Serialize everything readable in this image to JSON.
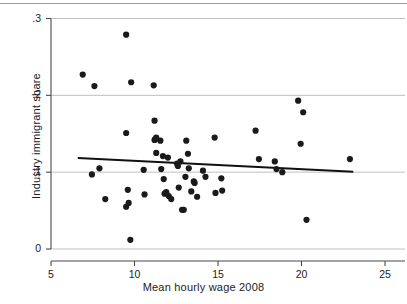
{
  "figure": {
    "background_color": "#ffffff",
    "ink_color": "#1c1c1c",
    "grid_color": "#bfbfbf",
    "axis_color": "#4a4a4a",
    "marker_color": "#1a1a1a",
    "fit_line_color": "#111111"
  },
  "chart_data": {
    "type": "scatter",
    "title": "",
    "subtitle": "",
    "xlabel": "Mean hourly wage 2008",
    "ylabel": "Industry immigrant share",
    "xlim": [
      5,
      25
    ],
    "ylim": [
      0,
      0.3
    ],
    "xticks": [
      5,
      10,
      15,
      20,
      25
    ],
    "xtick_labels": [
      "5",
      "10",
      "15",
      "20",
      "25"
    ],
    "yticks": [
      0,
      0.1,
      0.2,
      0.3
    ],
    "ytick_labels": [
      "0",
      ".1",
      ".2",
      ".3"
    ],
    "grid": "horizontal",
    "grid_values": [
      0,
      0.1,
      0.2,
      0.3
    ],
    "legend": "none",
    "legend_position": "none",
    "marker": "filled-circle",
    "marker_size_px": 4.2,
    "annotations": [],
    "series": [
      {
        "name": "Industry immigrant share vs mean hourly wage",
        "points": [
          [
            6.9,
            0.227
          ],
          [
            7.45,
            0.097
          ],
          [
            7.6,
            0.212
          ],
          [
            7.9,
            0.105
          ],
          [
            8.25,
            0.065
          ],
          [
            9.5,
            0.279
          ],
          [
            9.5,
            0.151
          ],
          [
            9.5,
            0.055
          ],
          [
            9.6,
            0.077
          ],
          [
            9.65,
            0.06
          ],
          [
            9.75,
            0.012
          ],
          [
            9.8,
            0.217
          ],
          [
            10.55,
            0.103
          ],
          [
            10.6,
            0.071
          ],
          [
            11.15,
            0.213
          ],
          [
            11.2,
            0.167
          ],
          [
            11.2,
            0.142
          ],
          [
            11.25,
            0.143
          ],
          [
            11.3,
            0.145
          ],
          [
            11.3,
            0.125
          ],
          [
            11.55,
            0.141
          ],
          [
            11.6,
            0.104
          ],
          [
            11.7,
            0.121
          ],
          [
            11.75,
            0.091
          ],
          [
            11.8,
            0.072
          ],
          [
            11.9,
            0.074
          ],
          [
            12.0,
            0.119
          ],
          [
            12.05,
            0.069
          ],
          [
            12.2,
            0.065
          ],
          [
            12.55,
            0.111
          ],
          [
            12.6,
            0.108
          ],
          [
            12.65,
            0.08
          ],
          [
            12.75,
            0.114
          ],
          [
            12.85,
            0.051
          ],
          [
            12.95,
            0.051
          ],
          [
            13.05,
            0.094
          ],
          [
            13.1,
            0.141
          ],
          [
            13.2,
            0.124
          ],
          [
            13.25,
            0.105
          ],
          [
            13.4,
            0.075
          ],
          [
            13.55,
            0.088
          ],
          [
            13.6,
            0.086
          ],
          [
            13.75,
            0.068
          ],
          [
            14.1,
            0.102
          ],
          [
            14.25,
            0.094
          ],
          [
            14.8,
            0.145
          ],
          [
            14.85,
            0.073
          ],
          [
            15.2,
            0.092
          ],
          [
            15.25,
            0.076
          ],
          [
            17.25,
            0.154
          ],
          [
            17.45,
            0.117
          ],
          [
            18.4,
            0.114
          ],
          [
            18.5,
            0.104
          ],
          [
            18.85,
            0.1
          ],
          [
            19.8,
            0.193
          ],
          [
            19.95,
            0.137
          ],
          [
            20.1,
            0.178
          ],
          [
            20.3,
            0.038
          ],
          [
            22.9,
            0.117
          ]
        ]
      }
    ],
    "fit_line": {
      "name": "linear fit",
      "x": [
        6.6,
        23.1
      ],
      "y": [
        0.1185,
        0.1005
      ]
    }
  }
}
